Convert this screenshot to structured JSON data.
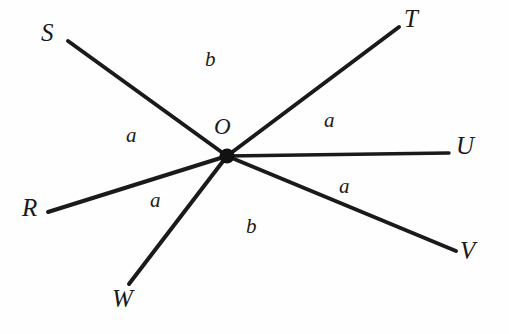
{
  "figure": {
    "background_color": "#fefefe",
    "line_color": "#1a1a1a",
    "text_color": "#1a1a1a",
    "width": 509,
    "height": 334,
    "vertex": {
      "label": "O",
      "label_x": 214,
      "label_y": 115,
      "x": 227,
      "y": 156,
      "dot_radius": 7.5
    },
    "rays": [
      {
        "name": "ray-OS",
        "endpoint_label": "S",
        "x1": 227,
        "y1": 156,
        "x2": 68,
        "y2": 41,
        "stroke_width": 4.0,
        "label_x": 41,
        "label_y": 20
      },
      {
        "name": "ray-OT",
        "endpoint_label": "T",
        "x1": 227,
        "y1": 156,
        "x2": 399,
        "y2": 27,
        "stroke_width": 4.0,
        "label_x": 404,
        "label_y": 6
      },
      {
        "name": "ray-OU",
        "endpoint_label": "U",
        "x1": 227,
        "y1": 156,
        "x2": 449,
        "y2": 153,
        "stroke_width": 3.4,
        "label_x": 456,
        "label_y": 133
      },
      {
        "name": "ray-OV",
        "endpoint_label": "V",
        "x1": 227,
        "y1": 156,
        "x2": 456,
        "y2": 251,
        "stroke_width": 4.0,
        "label_x": 460,
        "label_y": 238
      },
      {
        "name": "ray-OW",
        "endpoint_label": "W",
        "x1": 227,
        "y1": 156,
        "x2": 129,
        "y2": 284,
        "stroke_width": 4.0,
        "label_x": 112,
        "label_y": 286
      },
      {
        "name": "ray-OR",
        "endpoint_label": "R",
        "x1": 227,
        "y1": 156,
        "x2": 48,
        "y2": 212,
        "stroke_width": 4.0,
        "label_x": 22,
        "label_y": 195
      }
    ],
    "angle_labels": [
      {
        "name": "angle-label-SOT",
        "text": "b",
        "x": 205,
        "y": 49,
        "between": "S and T"
      },
      {
        "name": "angle-label-ROS",
        "text": "a",
        "x": 126,
        "y": 125,
        "between": "R and S"
      },
      {
        "name": "angle-label-TOU",
        "text": "a",
        "x": 324,
        "y": 110,
        "between": "T and U"
      },
      {
        "name": "angle-label-UOV",
        "text": "a",
        "x": 339,
        "y": 176,
        "between": "U and V"
      },
      {
        "name": "angle-label-WOV",
        "text": "b",
        "x": 246,
        "y": 216,
        "between": "W and V"
      },
      {
        "name": "angle-label-ROW",
        "text": "a",
        "x": 150,
        "y": 190,
        "between": "R and W"
      }
    ]
  }
}
